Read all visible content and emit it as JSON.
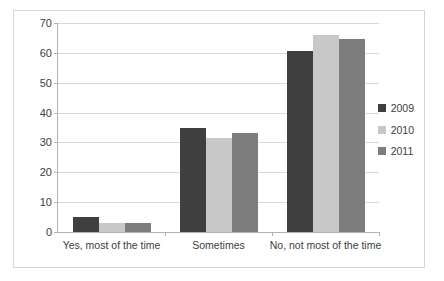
{
  "chart_data": {
    "type": "bar",
    "title": "",
    "xlabel": "",
    "ylabel": "",
    "ylim": [
      0,
      70
    ],
    "ytick_step": 10,
    "yticks": [
      0,
      10,
      20,
      30,
      40,
      50,
      60,
      70
    ],
    "grid": true,
    "legend_position": "right",
    "categories": [
      "Yes, most of the time",
      "Sometimes",
      "No, not most of the time"
    ],
    "series": [
      {
        "name": "2009",
        "color": "#3f3f3f",
        "values": [
          5,
          35,
          60.5
        ]
      },
      {
        "name": "2010",
        "color": "#c8c8c8",
        "values": [
          3,
          31.5,
          66
        ]
      },
      {
        "name": "2011",
        "color": "#7d7d7d",
        "values": [
          3,
          33,
          64.5
        ]
      }
    ]
  },
  "axis": {
    "ytick_labels": [
      "70",
      "60",
      "50",
      "40",
      "30",
      "20",
      "10",
      "0"
    ]
  },
  "legend": {
    "entries": [
      {
        "label": "2009",
        "color": "#3f3f3f"
      },
      {
        "label": "2010",
        "color": "#c8c8c8"
      },
      {
        "label": "2011",
        "color": "#7d7d7d"
      }
    ]
  },
  "colors": {
    "series_2009": "#3f3f3f",
    "series_2010": "#c8c8c8",
    "series_2011": "#7d7d7d",
    "gridline": "#d9d9d9",
    "axis": "#b3b3b3",
    "border": "#d6d6d6",
    "text": "#3d3d3d"
  }
}
